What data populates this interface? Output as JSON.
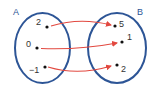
{
  "diagram": {
    "type": "mapping-diagram",
    "colors": {
      "set_outline": "#2d5596",
      "arrow": "#e2483f",
      "dot": "#111111",
      "text": "#333333",
      "set_label": "#2d5596"
    },
    "sets": [
      {
        "name": "A",
        "elements": [
          {
            "label": "2"
          },
          {
            "label": "0"
          },
          {
            "label": "−1"
          }
        ]
      },
      {
        "name": "B",
        "elements": [
          {
            "label": "5"
          },
          {
            "label": "1"
          },
          {
            "label": "2"
          }
        ]
      }
    ],
    "mappings": [
      {
        "from": "2",
        "to": "5"
      },
      {
        "from": "0",
        "to": "1"
      },
      {
        "from": "−1",
        "to": "2"
      }
    ]
  }
}
